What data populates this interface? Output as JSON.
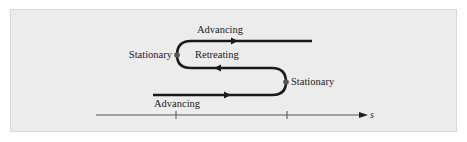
{
  "diagram": {
    "type": "motion-path",
    "labels": {
      "advancing_top": "Advancing",
      "retreating": "Retreating",
      "stationary_left": "Stationary",
      "stationary_right": "Stationary",
      "advancing_bottom": "Advancing"
    },
    "axis": {
      "label": "s",
      "ticks": 2
    },
    "colors": {
      "background": "#ececec",
      "path": "#1a1a1a",
      "axis": "#555555"
    }
  }
}
